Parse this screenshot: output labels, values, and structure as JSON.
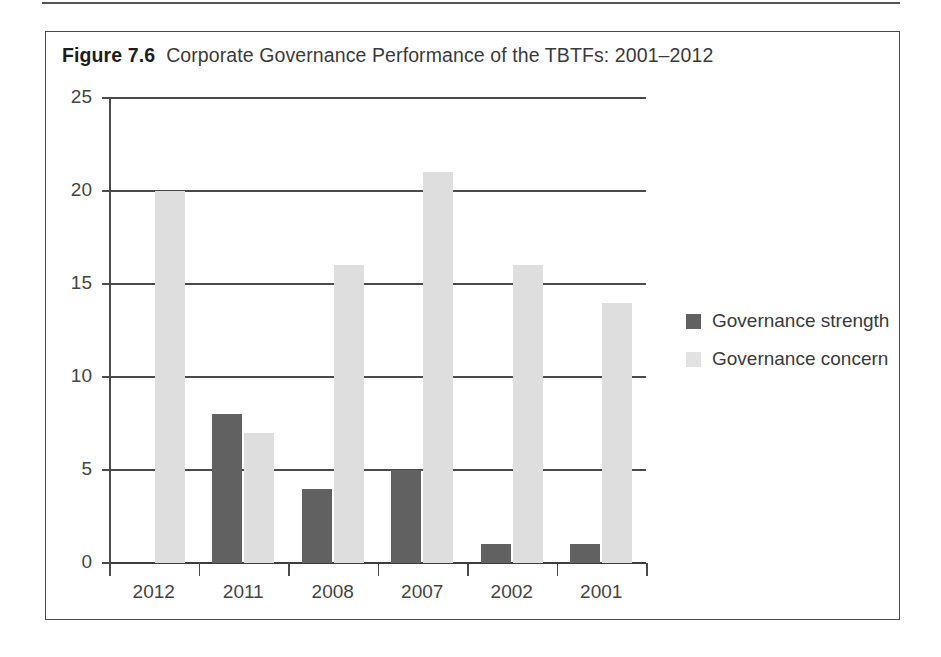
{
  "figure": {
    "label": "Figure 7.6",
    "title": "Corporate Governance Performance of the TBTFs: 2001–2012"
  },
  "colors": {
    "strength": "#616161",
    "concern": "#dedede",
    "axis": "#4a4a4a",
    "text": "#3a3a3a",
    "background": "#ffffff"
  },
  "chart_data": {
    "type": "bar",
    "title": "Corporate Governance Performance of the TBTFs: 2001–2012",
    "xlabel": "",
    "ylabel": "",
    "categories": [
      "2012",
      "2011",
      "2008",
      "2007",
      "2002",
      "2001"
    ],
    "series": [
      {
        "name": "Governance strength",
        "color": "#616161",
        "values": [
          0,
          8,
          4,
          5,
          1,
          1
        ]
      },
      {
        "name": "Governance concern",
        "color": "#dedede",
        "values": [
          20,
          7,
          16,
          21,
          16,
          14
        ]
      }
    ],
    "ylim": [
      0,
      25
    ],
    "yticks": [
      0,
      5,
      10,
      15,
      20,
      25
    ],
    "ytick_labels": [
      "0",
      "5",
      "10",
      "15",
      "20",
      "25"
    ],
    "grid": true,
    "grid_axis": "y",
    "legend_position": "right"
  },
  "legend": {
    "items": [
      {
        "label": "Governance strength",
        "swatch": "strength"
      },
      {
        "label": "Governance concern",
        "swatch": "concern"
      }
    ]
  }
}
